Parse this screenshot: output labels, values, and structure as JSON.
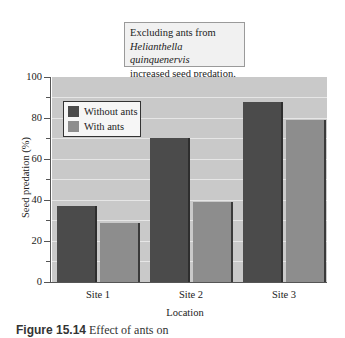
{
  "annotation": {
    "line1": "Excluding ants from",
    "line2": "Helianthella quinquenervis",
    "line3": "increased seed predation."
  },
  "legend": {
    "items": [
      {
        "label": "Without ants",
        "color": "#4b4b4b"
      },
      {
        "label": "With ants",
        "color": "#8d8d8d"
      }
    ]
  },
  "axes": {
    "ylabel": "Seed predation (%)",
    "xlabel": "Location",
    "yticks": [
      "100",
      "80",
      "60",
      "40",
      "20",
      "0"
    ],
    "xticks": [
      "Site 1",
      "Site 2",
      "Site 3"
    ]
  },
  "caption": {
    "label": "Figure 15.14",
    "text": "Effect of ants on"
  },
  "chart_data": {
    "type": "bar",
    "title": "Excluding ants from Helianthella quinquenervis increased seed predation.",
    "categories": [
      "Site 1",
      "Site 2",
      "Site 3"
    ],
    "series": [
      {
        "name": "Without ants",
        "values": [
          37,
          70,
          88
        ],
        "color": "#4b4b4b"
      },
      {
        "name": "With ants",
        "values": [
          29,
          39,
          79
        ],
        "color": "#8d8d8d"
      }
    ],
    "xlabel": "Location",
    "ylabel": "Seed predation (%)",
    "ylim": [
      0,
      100
    ],
    "yticks": [
      0,
      20,
      40,
      60,
      80,
      100
    ],
    "grid": true,
    "legend_position": "upper left"
  }
}
